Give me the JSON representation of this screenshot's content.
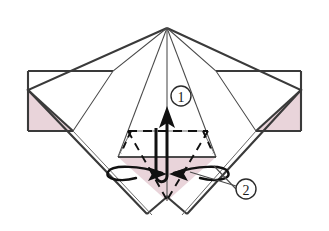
{
  "diagram": {
    "type": "origami-instruction",
    "canvas": {
      "width": 329,
      "height": 231
    },
    "colors": {
      "background": "#ffffff",
      "paper_front": "#ffffff",
      "paper_back_shaded": "#e9d4da",
      "line_dark": "#3a3a3a",
      "line_outline": "#2b2b2b",
      "line_thin": "#6b6b6b",
      "arrow_black": "#111111",
      "label_text": "#1a1a1a"
    },
    "step_labels": [
      {
        "id": "label-1",
        "text": "1",
        "cx": 181,
        "cy": 96,
        "r": 10,
        "meaning": "valley-fold-up-arrow"
      },
      {
        "id": "label-2",
        "text": "2",
        "cx": 246,
        "cy": 189,
        "r": 10,
        "meaning": "inside-reverse-fold-arrows"
      }
    ],
    "arrows": [
      {
        "id": "arrow-up-1",
        "kind": "fold-up-arrow",
        "points_to": "apex",
        "label_ref": "1",
        "tip_x": 167,
        "tip_y": 108,
        "tail_x": 163,
        "tail_y": 176
      },
      {
        "id": "arrow-in-left",
        "kind": "inside-reverse-arrow",
        "direction": "right",
        "label_ref": "2",
        "tip_x": 164,
        "tip_y": 174
      },
      {
        "id": "arrow-in-right",
        "kind": "inside-reverse-arrow",
        "direction": "left",
        "label_ref": "2",
        "tip_x": 172,
        "tip_y": 174
      }
    ],
    "line_styles": {
      "solid": "existing edge / visible crease",
      "dashed": "valley fold line"
    },
    "shaded_regions": [
      {
        "id": "left-back-triangle",
        "note": "reverse side of paper, left flap"
      },
      {
        "id": "right-back-triangle",
        "note": "reverse side of paper, right flap"
      },
      {
        "id": "center-back-triangle",
        "note": "reverse side of paper, center pocket"
      }
    ],
    "leader_lines": [
      {
        "id": "leader-2",
        "from_x": 236,
        "from_y": 186,
        "to_x": 190,
        "to_y": 172
      },
      {
        "id": "leader-2b",
        "from_x": 236,
        "from_y": 188,
        "to_x": 212,
        "to_y": 166
      }
    ]
  }
}
